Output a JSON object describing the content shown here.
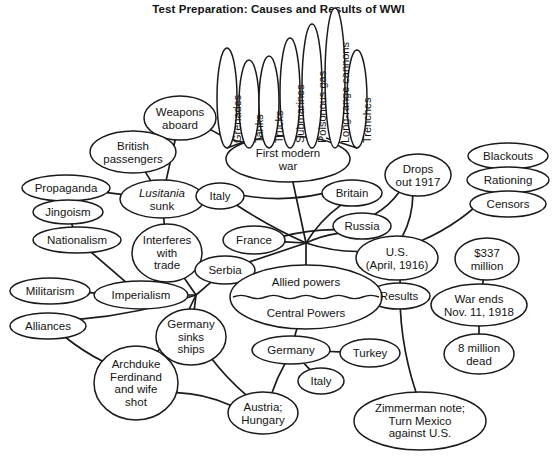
{
  "title": "Test Preparation:  Causes and Results of WWI",
  "diagram": {
    "type": "concept-map",
    "stroke_color": "#1a1a1a",
    "fill_color": "#ffffff",
    "text_color": "#141414",
    "vertical_nodes": [
      {
        "id": "grenades",
        "label": "Grenades",
        "cx": 227,
        "cy": 98,
        "rx": 10,
        "ry": 50
      },
      {
        "id": "tanks",
        "label": "Tanks",
        "cx": 249,
        "cy": 104,
        "rx": 10,
        "ry": 44
      },
      {
        "id": "trucks",
        "label": "Trucks",
        "cx": 269,
        "cy": 102,
        "rx": 10,
        "ry": 46
      },
      {
        "id": "submarines",
        "label": "Submarines",
        "cx": 290,
        "cy": 93,
        "rx": 10,
        "ry": 55
      },
      {
        "id": "poisongas",
        "label": "Poisonous gas",
        "cx": 312,
        "cy": 86,
        "rx": 10,
        "ry": 62
      },
      {
        "id": "cannons",
        "label": "Long-range cannons",
        "cx": 335,
        "cy": 78,
        "rx": 10,
        "ry": 70
      },
      {
        "id": "trenches",
        "label": "Trenches",
        "cx": 357,
        "cy": 99,
        "rx": 10,
        "ry": 49
      }
    ],
    "nodes": [
      {
        "id": "first-modern-war",
        "label": "First modern\nwar",
        "cx": 288,
        "cy": 159,
        "rx": 62,
        "ry": 23
      },
      {
        "id": "weapons-aboard",
        "label": "Weapons\naboard",
        "cx": 180,
        "cy": 118,
        "rx": 36,
        "ry": 22
      },
      {
        "id": "british-passengers",
        "label": "British\npassengers",
        "cx": 133,
        "cy": 152,
        "rx": 43,
        "ry": 21
      },
      {
        "id": "propaganda",
        "label": "Propaganda",
        "cx": 66,
        "cy": 188,
        "rx": 44,
        "ry": 13
      },
      {
        "id": "jingoism",
        "label": "Jingoism",
        "cx": 68,
        "cy": 212,
        "rx": 35,
        "ry": 12
      },
      {
        "id": "lusitania-sunk",
        "label": "Lusitania\nsunk",
        "cx": 162,
        "cy": 199,
        "rx": 42,
        "ry": 19,
        "italic_first_line": true
      },
      {
        "id": "nationalism",
        "label": "Nationalism",
        "cx": 77,
        "cy": 240,
        "rx": 44,
        "ry": 13
      },
      {
        "id": "interferes-trade",
        "label": "Interferes\nwith\ntrade",
        "cx": 167,
        "cy": 253,
        "rx": 35,
        "ry": 29
      },
      {
        "id": "militarism",
        "label": "Militarism",
        "cx": 50,
        "cy": 291,
        "rx": 40,
        "ry": 13
      },
      {
        "id": "imperialism",
        "label": "Imperialism",
        "cx": 141,
        "cy": 295,
        "rx": 47,
        "ry": 14
      },
      {
        "id": "alliances",
        "label": "Alliances",
        "cx": 48,
        "cy": 326,
        "rx": 38,
        "ry": 13
      },
      {
        "id": "italy-top",
        "label": "Italy",
        "cx": 220,
        "cy": 196,
        "rx": 24,
        "ry": 13
      },
      {
        "id": "france",
        "label": "France",
        "cx": 254,
        "cy": 240,
        "rx": 31,
        "ry": 14
      },
      {
        "id": "serbia",
        "label": "Serbia",
        "cx": 225,
        "cy": 270,
        "rx": 30,
        "ry": 14
      },
      {
        "id": "britain",
        "label": "Britain",
        "cx": 352,
        "cy": 193,
        "rx": 30,
        "ry": 13
      },
      {
        "id": "russia",
        "label": "Russia",
        "cx": 362,
        "cy": 226,
        "rx": 29,
        "ry": 13
      },
      {
        "id": "drops-out-1917",
        "label": "Drops\nout 1917",
        "cx": 418,
        "cy": 175,
        "rx": 33,
        "ry": 21
      },
      {
        "id": "us-april-1916",
        "label": "U.S.\n(April, 1916)",
        "cx": 397,
        "cy": 258,
        "rx": 41,
        "ry": 22
      },
      {
        "id": "blackouts",
        "label": "Blackouts",
        "cx": 508,
        "cy": 156,
        "rx": 40,
        "ry": 13
      },
      {
        "id": "rationing",
        "label": "Rationing",
        "cx": 508,
        "cy": 180,
        "rx": 41,
        "ry": 13
      },
      {
        "id": "censors",
        "label": "Censors",
        "cx": 508,
        "cy": 204,
        "rx": 38,
        "ry": 13
      },
      {
        "id": "dollars-337",
        "label": "$337\nmillion",
        "cx": 487,
        "cy": 259,
        "rx": 32,
        "ry": 21
      },
      {
        "id": "war-ends",
        "label": "War ends\nNov. 11, 1918",
        "cx": 479,
        "cy": 305,
        "rx": 48,
        "ry": 21
      },
      {
        "id": "eight-million",
        "label": "8 million\ndead",
        "cx": 479,
        "cy": 354,
        "rx": 35,
        "ry": 20
      },
      {
        "id": "results",
        "label": "Results",
        "cx": 399,
        "cy": 296,
        "rx": 31,
        "ry": 13
      },
      {
        "id": "germany-sinks",
        "label": "Germany\nsinks\nships",
        "cx": 191,
        "cy": 337,
        "rx": 35,
        "ry": 28
      },
      {
        "id": "germany",
        "label": "Germany",
        "cx": 291,
        "cy": 350,
        "rx": 39,
        "ry": 14
      },
      {
        "id": "turkey",
        "label": "Turkey",
        "cx": 370,
        "cy": 353,
        "rx": 30,
        "ry": 14
      },
      {
        "id": "italy-bottom",
        "label": "Italy",
        "cx": 321,
        "cy": 381,
        "rx": 23,
        "ry": 13
      },
      {
        "id": "austria-hungary",
        "label": "Austria;\nHungary",
        "cx": 263,
        "cy": 413,
        "rx": 35,
        "ry": 21
      },
      {
        "id": "archduke",
        "label": "Archduke\nFerdinand\nand wife\nshot",
        "cx": 136,
        "cy": 383,
        "rx": 42,
        "ry": 37
      },
      {
        "id": "zimmerman-note",
        "label": "Zimmerman note;\nTurn Mexico\nagainst U.S.",
        "cx": 420,
        "cy": 421,
        "rx": 66,
        "ry": 29
      }
    ],
    "split_node": {
      "id": "powers",
      "top_label": "Allied powers",
      "bottom_label": "Central Powers",
      "cx": 306,
      "cy": 297,
      "rx": 76,
      "ry": 32,
      "divider": "wavy"
    },
    "hubs": [
      {
        "id": "hub-center",
        "cx": 306,
        "cy": 243
      },
      {
        "id": "hub-left",
        "cx": 196,
        "cy": 295
      }
    ]
  }
}
